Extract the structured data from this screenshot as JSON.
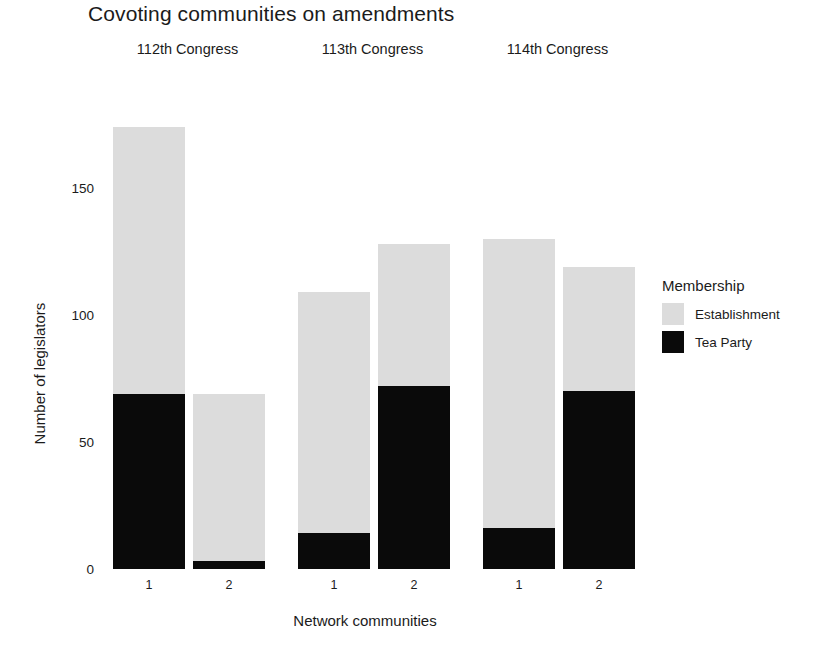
{
  "chart_data": {
    "type": "bar",
    "subtype": "stacked",
    "title": "Covoting communities on amendments",
    "xlabel": "Network communities",
    "ylabel": "Number of legislators",
    "ylim": [
      0,
      175
    ],
    "yticks": [
      0,
      50,
      100,
      150
    ],
    "ytick_labels": [
      "0",
      "50",
      "100",
      "150"
    ],
    "grid": false,
    "legend": {
      "title": "Membership",
      "position": "right",
      "entries": [
        {
          "name": "Establishment",
          "color": "#dcdcdc"
        },
        {
          "name": "Tea Party",
          "color": "#0a0a0a"
        }
      ]
    },
    "facet_variable": "Congress",
    "facets": [
      {
        "label": "112th Congress",
        "categories": [
          "1",
          "2"
        ],
        "series": [
          {
            "name": "Tea Party",
            "color": "#0a0a0a",
            "values": [
              69,
              3
            ]
          },
          {
            "name": "Establishment",
            "color": "#dcdcdc",
            "values": [
              105,
              66
            ]
          }
        ],
        "totals": [
          174,
          69
        ]
      },
      {
        "label": "113th Congress",
        "categories": [
          "1",
          "2"
        ],
        "series": [
          {
            "name": "Tea Party",
            "color": "#0a0a0a",
            "values": [
              14,
              72
            ]
          },
          {
            "name": "Establishment",
            "color": "#dcdcdc",
            "values": [
              95,
              56
            ]
          }
        ],
        "totals": [
          109,
          128
        ]
      },
      {
        "label": "114th Congress",
        "categories": [
          "1",
          "2"
        ],
        "series": [
          {
            "name": "Tea Party",
            "color": "#0a0a0a",
            "values": [
              16,
              70
            ]
          },
          {
            "name": "Establishment",
            "color": "#dcdcdc",
            "values": [
              114,
              49
            ]
          }
        ],
        "totals": [
          130,
          119
        ]
      }
    ]
  }
}
